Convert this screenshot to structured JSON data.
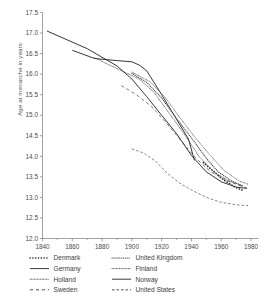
{
  "chart_data": {
    "type": "line",
    "title": "",
    "xlabel": "",
    "ylabel": "Age at menarche in years",
    "xlim": [
      1840,
      1985
    ],
    "ylim": [
      12.0,
      17.5
    ],
    "grid": false,
    "legend_position": "below-axes",
    "xticks": [
      1840,
      1860,
      1880,
      1900,
      1920,
      1940,
      1960,
      1980
    ],
    "xtick_labels": [
      "1840",
      "1860",
      "1880",
      "1900",
      "1920",
      "1940",
      "1960",
      "1980"
    ],
    "xminor_ticks": [
      1850,
      1870,
      1890,
      1910,
      1930,
      1950,
      1970
    ],
    "yticks": [
      12.0,
      12.5,
      13.0,
      13.5,
      14.0,
      14.5,
      15.0,
      15.5,
      16.0,
      16.5,
      17.0,
      17.5
    ],
    "ytick_labels": [
      "12.0",
      "12.5",
      "13.0",
      "13.5",
      "14.0",
      "14.5",
      "15.0",
      "15.5",
      "16.0",
      "16.5",
      "17.0",
      "17.5"
    ],
    "series": [
      {
        "name": "Denmark",
        "style": "dotted-heavy",
        "color": "#1a1a1a",
        "points": [
          [
            1948,
            13.85
          ],
          [
            1952,
            13.72
          ],
          [
            1956,
            13.6
          ],
          [
            1960,
            13.47
          ],
          [
            1964,
            13.37
          ],
          [
            1968,
            13.28
          ],
          [
            1971,
            13.22
          ],
          [
            1974,
            13.18
          ]
        ]
      },
      {
        "name": "Germany",
        "style": "solid",
        "color": "#2b2b2b",
        "points": [
          [
            1860,
            16.58
          ],
          [
            1875,
            16.38
          ],
          [
            1890,
            16.33
          ],
          [
            1900,
            16.3
          ],
          [
            1905,
            16.22
          ],
          [
            1910,
            16.08
          ],
          [
            1920,
            15.5
          ],
          [
            1930,
            14.9
          ],
          [
            1938,
            14.42
          ],
          [
            1942,
            13.9
          ]
        ]
      },
      {
        "name": "Holland",
        "style": "dotted-fine",
        "color": "#3a3a3a",
        "points": [
          [
            1875,
            16.4
          ],
          [
            1885,
            16.22
          ],
          [
            1895,
            16.05
          ],
          [
            1905,
            15.88
          ],
          [
            1915,
            15.55
          ],
          [
            1925,
            15.05
          ],
          [
            1935,
            14.55
          ],
          [
            1945,
            14.0
          ],
          [
            1955,
            13.62
          ],
          [
            1965,
            13.4
          ],
          [
            1975,
            13.28
          ]
        ]
      },
      {
        "name": "Sweden",
        "style": "dash-dot",
        "color": "#5a5a5a",
        "points": [
          [
            1893,
            15.72
          ],
          [
            1903,
            15.5
          ],
          [
            1913,
            15.22
          ],
          [
            1923,
            14.82
          ],
          [
            1933,
            14.38
          ],
          [
            1943,
            13.95
          ],
          [
            1953,
            13.62
          ],
          [
            1963,
            13.42
          ],
          [
            1973,
            13.28
          ],
          [
            1978,
            13.22
          ]
        ]
      },
      {
        "name": "United Kingdom",
        "style": "dotted-medium",
        "color": "#3a3a3a",
        "points": [
          [
            1900,
            16.02
          ],
          [
            1910,
            15.8
          ],
          [
            1920,
            15.42
          ],
          [
            1930,
            14.92
          ],
          [
            1940,
            14.45
          ],
          [
            1950,
            13.95
          ],
          [
            1958,
            13.62
          ],
          [
            1966,
            13.42
          ],
          [
            1974,
            13.28
          ]
        ]
      },
      {
        "name": "Finland",
        "style": "dotted-fine",
        "color": "#4a4a4a",
        "points": [
          [
            1900,
            16.05
          ],
          [
            1912,
            15.82
          ],
          [
            1922,
            15.45
          ],
          [
            1932,
            14.95
          ],
          [
            1942,
            14.48
          ],
          [
            1952,
            14.05
          ],
          [
            1962,
            13.65
          ],
          [
            1972,
            13.4
          ],
          [
            1978,
            13.32
          ]
        ]
      },
      {
        "name": "Norway",
        "style": "solid",
        "color": "#2b2b2b",
        "points": [
          [
            1843,
            17.05
          ],
          [
            1870,
            16.62
          ],
          [
            1890,
            16.2
          ],
          [
            1900,
            15.88
          ],
          [
            1910,
            15.45
          ],
          [
            1920,
            15.0
          ],
          [
            1930,
            14.55
          ],
          [
            1940,
            14.02
          ],
          [
            1950,
            13.62
          ],
          [
            1960,
            13.38
          ],
          [
            1970,
            13.25
          ],
          [
            1977,
            13.22
          ]
        ]
      },
      {
        "name": "United States",
        "style": "dashed",
        "color": "#707070",
        "points": [
          [
            1900,
            14.18
          ],
          [
            1908,
            14.08
          ],
          [
            1916,
            13.88
          ],
          [
            1924,
            13.58
          ],
          [
            1932,
            13.35
          ],
          [
            1940,
            13.18
          ],
          [
            1950,
            13.0
          ],
          [
            1960,
            12.88
          ],
          [
            1970,
            12.82
          ],
          [
            1978,
            12.8
          ]
        ]
      }
    ]
  },
  "legend": {
    "columns": [
      {
        "entries": [
          {
            "label": "Denmark",
            "style": "dotted-heavy"
          },
          {
            "label": "Germany",
            "style": "solid"
          },
          {
            "label": "Holland",
            "style": "dotted-fine"
          },
          {
            "label": "Sweden",
            "style": "dash-dot"
          }
        ]
      },
      {
        "entries": [
          {
            "label": "United Kingdom",
            "style": "dotted-medium"
          },
          {
            "label": "Finland",
            "style": "dotted-fine"
          },
          {
            "label": "Norway",
            "style": "solid"
          },
          {
            "label": "United States",
            "style": "dashed"
          }
        ]
      }
    ]
  },
  "axis": {
    "ylabel_text": "Age at menarche in years"
  }
}
